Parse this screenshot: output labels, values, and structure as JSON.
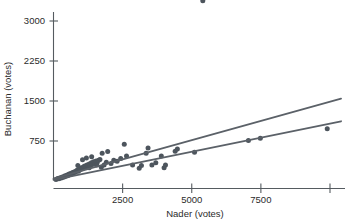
{
  "chart_data": {
    "type": "scatter",
    "title": "",
    "xlabel": "Nader (votes)",
    "ylabel": "Buchanan (votes)",
    "xlim": [
      0,
      10400
    ],
    "ylim": [
      0,
      3600
    ],
    "xticks": [
      2500,
      5000,
      7500,
      10000
    ],
    "xtick_labels": [
      "2500",
      "5000",
      "7500",
      ""
    ],
    "yticks": [
      750,
      1500,
      2250,
      3000
    ],
    "ytick_labels": [
      "750",
      "1500",
      "2250",
      "3000"
    ],
    "grid": false,
    "legend": null,
    "point_color": "#4d555d",
    "line_color": "#5b6168",
    "axis_color": "#555b60",
    "points": [
      [
        90,
        30
      ],
      [
        150,
        45
      ],
      [
        195,
        40
      ],
      [
        240,
        60
      ],
      [
        280,
        55
      ],
      [
        320,
        75
      ],
      [
        360,
        70
      ],
      [
        400,
        95
      ],
      [
        430,
        85
      ],
      [
        470,
        110
      ],
      [
        510,
        100
      ],
      [
        545,
        125
      ],
      [
        580,
        115
      ],
      [
        610,
        140
      ],
      [
        650,
        130
      ],
      [
        690,
        160
      ],
      [
        720,
        150
      ],
      [
        760,
        175
      ],
      [
        795,
        165
      ],
      [
        830,
        190
      ],
      [
        870,
        205
      ],
      [
        905,
        185
      ],
      [
        940,
        225
      ],
      [
        975,
        215
      ],
      [
        1010,
        250
      ],
      [
        1050,
        235
      ],
      [
        1090,
        265
      ],
      [
        1130,
        280
      ],
      [
        1170,
        255
      ],
      [
        1210,
        300
      ],
      [
        1250,
        275
      ],
      [
        1290,
        320
      ],
      [
        1330,
        295
      ],
      [
        1370,
        340
      ],
      [
        1410,
        310
      ],
      [
        1450,
        360
      ],
      [
        1500,
        330
      ],
      [
        1540,
        375
      ],
      [
        1580,
        345
      ],
      [
        1630,
        390
      ],
      [
        1190,
        430
      ],
      [
        1380,
        455
      ],
      [
        1560,
        300
      ],
      [
        1680,
        405
      ],
      [
        1760,
        520
      ],
      [
        1830,
        300
      ],
      [
        1910,
        350
      ],
      [
        1960,
        555
      ],
      [
        2080,
        330
      ],
      [
        2180,
        390
      ],
      [
        2300,
        370
      ],
      [
        2430,
        420
      ],
      [
        2560,
        690
      ],
      [
        2640,
        470
      ],
      [
        2860,
        300
      ],
      [
        3100,
        240
      ],
      [
        3180,
        290
      ],
      [
        3350,
        520
      ],
      [
        3420,
        620
      ],
      [
        3560,
        300
      ],
      [
        3700,
        340
      ],
      [
        3900,
        470
      ],
      [
        4000,
        250
      ],
      [
        4050,
        300
      ],
      [
        4400,
        560
      ],
      [
        4480,
        600
      ],
      [
        5100,
        540
      ],
      [
        5400,
        3380
      ],
      [
        7050,
        760
      ],
      [
        7480,
        800
      ],
      [
        9900,
        980
      ],
      [
        1050,
        400
      ],
      [
        1290,
        250
      ],
      [
        880,
        290
      ],
      [
        1730,
        260
      ]
    ],
    "fit_lines": [
      {
        "name": "upper-fit",
        "x0": 0,
        "y0": 45,
        "x1": 10400,
        "y1": 1545
      },
      {
        "name": "lower-fit",
        "x0": 0,
        "y0": 20,
        "x1": 10400,
        "y1": 1120
      }
    ]
  }
}
